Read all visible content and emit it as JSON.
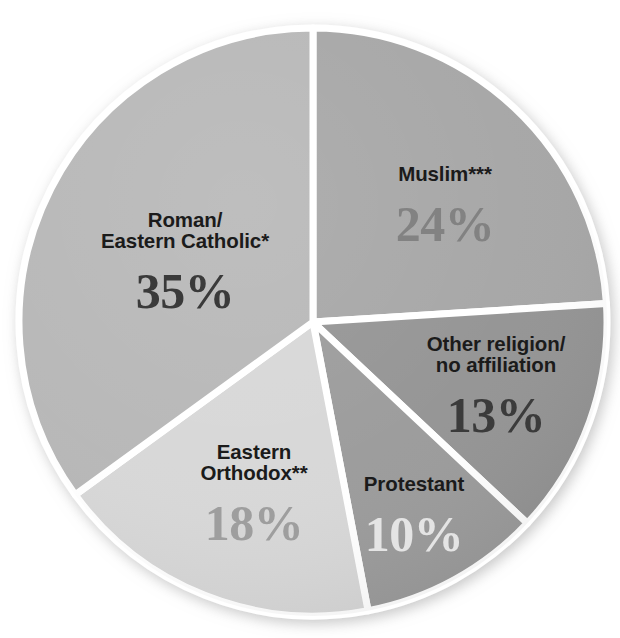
{
  "chart_data": {
    "type": "pie",
    "title": "",
    "subtitle": "",
    "xlabel": "",
    "ylabel": "",
    "legend_position": "none",
    "labels_inside_slices": true,
    "start_angle_deg": 0,
    "direction": "clockwise",
    "units": "percent",
    "total": 100,
    "categories": [
      "Muslim***",
      "Other religion/\nno affiliation",
      "Protestant",
      "Eastern\nOrthodox**",
      "Roman/\nEastern Catholic*"
    ],
    "values": [
      24,
      13,
      10,
      18,
      35
    ],
    "value_labels": [
      "24%",
      "13%",
      "10%",
      "18%",
      "35%"
    ],
    "slices": [
      {
        "id": "muslim",
        "name": "Muslim***",
        "value": 24,
        "value_label": "24%",
        "fill": "#a6a6a6",
        "value_color": "#828282",
        "name_color": "#1b1b1b",
        "start_angle_deg": 0,
        "end_angle_deg": 86.4
      },
      {
        "id": "other",
        "name": "Other religion/\nno affiliation",
        "value": 13,
        "value_label": "13%",
        "fill": "#949494",
        "value_color": "#3b3b3b",
        "name_color": "#1b1b1b",
        "start_angle_deg": 86.4,
        "end_angle_deg": 133.2
      },
      {
        "id": "protestant",
        "name": "Protestant",
        "value": 10,
        "value_label": "10%",
        "fill": "#9b9b9b",
        "value_color": "#e4e4e4",
        "name_color": "#1b1b1b",
        "start_angle_deg": 133.2,
        "end_angle_deg": 169.2
      },
      {
        "id": "orthodox",
        "name": "Eastern\nOrthodox**",
        "value": 18,
        "value_label": "18%",
        "fill": "#d7d7d7",
        "value_color": "#9e9e9e",
        "name_color": "#1b1b1b",
        "start_angle_deg": 169.2,
        "end_angle_deg": 234.0
      },
      {
        "id": "catholic",
        "name": "Roman/\nEastern Catholic*",
        "value": 35,
        "value_label": "35%",
        "fill": "#b7b7b7",
        "value_color": "#3a3a3a",
        "name_color": "#1b1b1b",
        "start_angle_deg": 234.0,
        "end_angle_deg": 360.0
      }
    ],
    "separator_color": "#ffffff",
    "background": "#ffffff"
  }
}
